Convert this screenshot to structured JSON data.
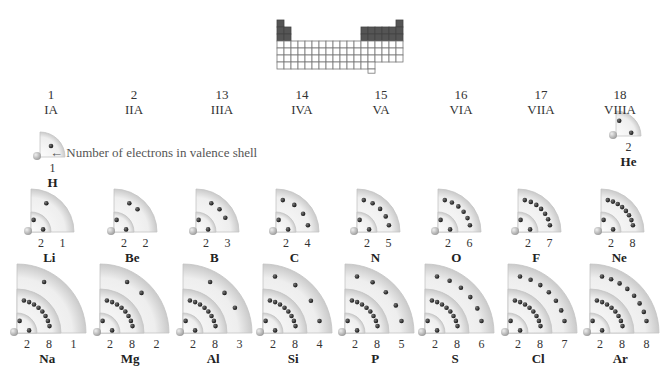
{
  "mini_table": {
    "cell": 7,
    "x": 277,
    "y": 20,
    "dark_color": "#555555",
    "line_color": "#777777"
  },
  "groups": [
    {
      "number": "1",
      "roman": "IA",
      "cx": 51
    },
    {
      "number": "2",
      "roman": "IIA",
      "cx": 134
    },
    {
      "number": "13",
      "roman": "IIIA",
      "cx": 222
    },
    {
      "number": "14",
      "roman": "IVA",
      "cx": 302
    },
    {
      "number": "15",
      "roman": "VA",
      "cx": 381
    },
    {
      "number": "16",
      "roman": "VIA",
      "cx": 461
    },
    {
      "number": "17",
      "roman": "VIIA",
      "cx": 541
    },
    {
      "number": "18",
      "roman": "VIIIA",
      "cx": 620
    }
  ],
  "callout": {
    "text": "Number of electrons in valence shell",
    "arrow": "←"
  },
  "colors": {
    "shell_light": "#f4f4f4",
    "shell_dark": "#cfcfcf",
    "shell_edge": "#bdbdbd",
    "electron": "#2a2a2a",
    "nucleus": "#bcbcbc"
  },
  "atoms": [
    {
      "symbol": "H",
      "shells": [
        1
      ],
      "ox": 40,
      "oy": 157,
      "radii": [
        25
      ]
    },
    {
      "symbol": "He",
      "shells": [
        2
      ],
      "ox": 616,
      "oy": 136,
      "radii": [
        25
      ]
    },
    {
      "symbol": "Li",
      "shells": [
        2,
        1
      ],
      "ox": 31,
      "oy": 232,
      "radii": [
        20,
        43
      ]
    },
    {
      "symbol": "Be",
      "shells": [
        2,
        2
      ],
      "ox": 114,
      "oy": 232,
      "radii": [
        20,
        43
      ]
    },
    {
      "symbol": "B",
      "shells": [
        2,
        3
      ],
      "ox": 196,
      "oy": 232,
      "radii": [
        20,
        43
      ]
    },
    {
      "symbol": "C",
      "shells": [
        2,
        4
      ],
      "ox": 276,
      "oy": 232,
      "radii": [
        20,
        43
      ]
    },
    {
      "symbol": "N",
      "shells": [
        2,
        5
      ],
      "ox": 357,
      "oy": 232,
      "radii": [
        20,
        43
      ]
    },
    {
      "symbol": "O",
      "shells": [
        2,
        6
      ],
      "ox": 438,
      "oy": 232,
      "radii": [
        20,
        43
      ]
    },
    {
      "symbol": "F",
      "shells": [
        2,
        7
      ],
      "ox": 518,
      "oy": 232,
      "radii": [
        20,
        43
      ]
    },
    {
      "symbol": "Ne",
      "shells": [
        2,
        8
      ],
      "ox": 601,
      "oy": 232,
      "radii": [
        20,
        43
      ]
    },
    {
      "symbol": "Na",
      "shells": [
        2,
        8,
        1
      ],
      "ox": 17,
      "oy": 333,
      "radii": [
        20,
        44,
        69
      ]
    },
    {
      "symbol": "Mg",
      "shells": [
        2,
        8,
        2
      ],
      "ox": 100,
      "oy": 333,
      "radii": [
        20,
        44,
        69
      ]
    },
    {
      "symbol": "Al",
      "shells": [
        2,
        8,
        3
      ],
      "ox": 183,
      "oy": 333,
      "radii": [
        20,
        44,
        69
      ]
    },
    {
      "symbol": "Si",
      "shells": [
        2,
        8,
        4
      ],
      "ox": 263,
      "oy": 333,
      "radii": [
        20,
        44,
        69
      ]
    },
    {
      "symbol": "P",
      "shells": [
        2,
        8,
        5
      ],
      "ox": 345,
      "oy": 333,
      "radii": [
        20,
        44,
        69
      ]
    },
    {
      "symbol": "S",
      "shells": [
        2,
        8,
        6
      ],
      "ox": 425,
      "oy": 333,
      "radii": [
        20,
        44,
        69
      ]
    },
    {
      "symbol": "Cl",
      "shells": [
        2,
        8,
        7
      ],
      "ox": 508,
      "oy": 333,
      "radii": [
        20,
        44,
        69
      ]
    },
    {
      "symbol": "Ar",
      "shells": [
        2,
        8,
        8
      ],
      "ox": 590,
      "oy": 333,
      "radii": [
        20,
        44,
        69
      ]
    }
  ]
}
